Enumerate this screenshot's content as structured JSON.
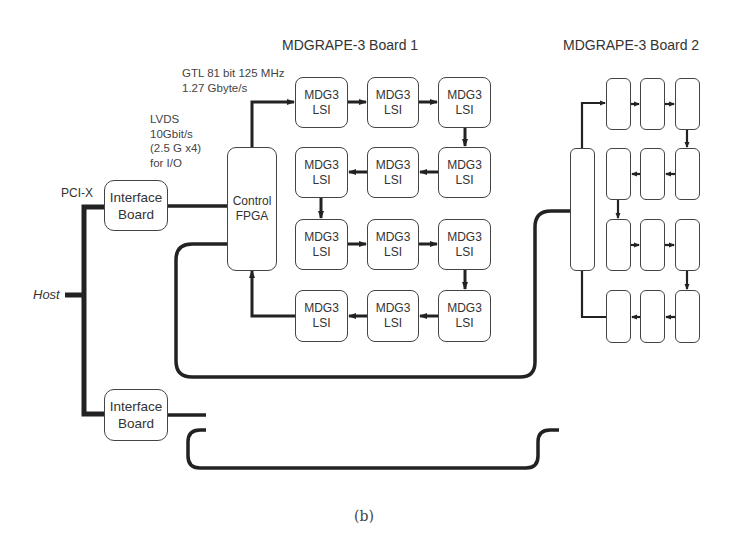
{
  "figure": {
    "caption": "(b)",
    "host_label": "Host",
    "pci_label": "PCI-X",
    "lvds_annotation": "LVDS\n10Gbit/s\n(2.5 G x4)\nfor I/O",
    "gtl_annotation": "GTL 81 bit 125 MHz\n1.27 Gbyte/s"
  },
  "interface_boards": [
    {
      "line1": "Interface",
      "line2": "Board"
    },
    {
      "line1": "Interface",
      "line2": "Board"
    }
  ],
  "boards": [
    {
      "title": "MDGRAPE-3 Board 1",
      "fpga_line1": "Control",
      "fpga_line2": "FPGA",
      "chip_line1": "MDG3",
      "chip_line2": "LSI",
      "chip_rows": 4,
      "chip_cols": 3
    },
    {
      "title": "MDGRAPE-3 Board 2",
      "chip_rows": 4,
      "chip_cols": 3
    },
    {
      "title": "MDGRAPE-3 Board 3"
    },
    {
      "title": "MDGRAPE-3 Board 4"
    }
  ],
  "colors": {
    "board_fill": "#e4e4e4",
    "line": "#222222",
    "chip_fill": "#ffffff"
  }
}
